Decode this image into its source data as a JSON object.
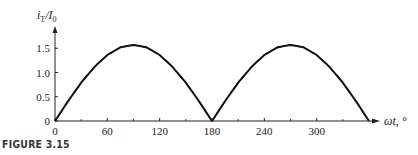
{
  "figure_label": "FIGURE 3.15",
  "chart_data": {
    "type": "line",
    "title": "",
    "ylabel": "iT/I0",
    "ylabel_main": "i",
    "ylabel_sub1": "T",
    "ylabel_slash": "/I",
    "ylabel_sub2": "0",
    "xlabel": "ωt, °",
    "xlim": [
      0,
      360
    ],
    "ylim": [
      0,
      1.8
    ],
    "x_ticks": [
      0,
      60,
      120,
      180,
      240,
      300
    ],
    "x_tick_labels": [
      "0",
      "60",
      "120",
      "180",
      "240",
      "300"
    ],
    "x_minor_ticks": [
      30,
      90,
      150,
      210,
      270,
      330
    ],
    "y_ticks": [
      0,
      0.5,
      1.0,
      1.5
    ],
    "y_tick_labels": [
      "0",
      "0.5",
      "1.0",
      "1.5"
    ],
    "grid": false,
    "legend": null,
    "series": [
      {
        "name": "iT/I0",
        "description": "(π/2)·|sin ωt|",
        "x": [
          0,
          15,
          30,
          45,
          60,
          75,
          90,
          105,
          120,
          135,
          150,
          165,
          180,
          195,
          210,
          225,
          240,
          255,
          270,
          285,
          300,
          315,
          330,
          345,
          360
        ],
        "values": [
          0,
          0.41,
          0.79,
          1.11,
          1.36,
          1.52,
          1.57,
          1.52,
          1.36,
          1.11,
          0.79,
          0.41,
          0,
          0.41,
          0.79,
          1.11,
          1.36,
          1.52,
          1.57,
          1.52,
          1.36,
          1.11,
          0.79,
          0.41,
          0
        ]
      }
    ]
  }
}
